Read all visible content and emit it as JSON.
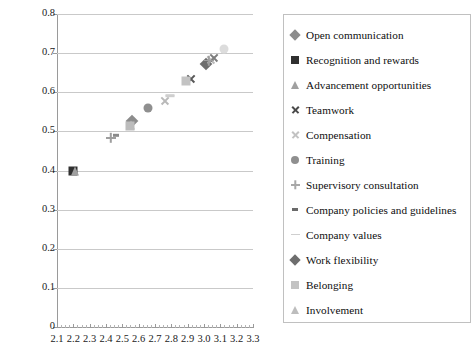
{
  "chart_data": {
    "type": "scatter",
    "title": "",
    "xlabel": "",
    "ylabel": "",
    "xlim": [
      2.1,
      3.3
    ],
    "ylim": [
      0.0,
      0.8
    ],
    "xticks": [
      "2.1",
      "2.2",
      "2.3",
      "2.4",
      "2.5",
      "2.6",
      "2.7",
      "2.8",
      "2.9",
      "3.0",
      "3.1",
      "3.2",
      "3.3"
    ],
    "yticks": [
      "0",
      "0.1",
      "0.2",
      "0.3",
      "0.4",
      "0.5",
      "0.6",
      "0.7",
      "0.8"
    ],
    "grid": "horizontal",
    "legend_position": "right",
    "series": [
      {
        "name": "Open communication",
        "marker": "diamond",
        "color": "#8c8c8c",
        "x": 2.56,
        "y": 0.527
      },
      {
        "name": "Recognition and rewards",
        "marker": "square",
        "color": "#303030",
        "x": 2.2,
        "y": 0.4
      },
      {
        "name": "Advancement opportunities",
        "marker": "triangle",
        "color": "#a0a0a0",
        "x": 2.21,
        "y": 0.4
      },
      {
        "name": "Teamwork",
        "marker": "cross",
        "color": "#585858",
        "x": 2.92,
        "y": 0.636
      },
      {
        "name": "Compensation",
        "marker": "cross",
        "color": "#b9b9b9",
        "x": 2.76,
        "y": 0.578
      },
      {
        "name": "Training",
        "marker": "circle",
        "color": "#8f8f8f",
        "x": 2.66,
        "y": 0.561
      },
      {
        "name": "Supervisory consultation",
        "marker": "plus",
        "color": "#9e9e9e",
        "x": 2.43,
        "y": 0.484
      },
      {
        "name": "Company policies and guidelines",
        "marker": "dash",
        "color": "#8a8a8a",
        "x": 2.46,
        "y": 0.49
      },
      {
        "name": "Company values",
        "marker": "line",
        "color": "#cfcfcf",
        "x": 2.79,
        "y": 0.59
      },
      {
        "name": "Work flexibility",
        "marker": "diamond",
        "color": "#6e6e6e",
        "x": 3.01,
        "y": 0.672
      },
      {
        "name": "Belonging",
        "marker": "square",
        "color": "#c3c3c3",
        "x": 2.89,
        "y": 0.63
      },
      {
        "name": "Involvement",
        "marker": "triangle",
        "color": "#bdbdbd",
        "x": 2.55,
        "y": 0.516
      }
    ],
    "extra_points": [
      {
        "series": "Company values",
        "marker": "circle",
        "color": "#dcdcdc",
        "x": 3.12,
        "y": 0.71
      },
      {
        "series": "Compensation",
        "marker": "cross",
        "color": "#b9b9b9",
        "x": 3.04,
        "y": 0.684
      },
      {
        "series": "Teamwork",
        "marker": "cross",
        "color": "#7d7d7d",
        "x": 3.06,
        "y": 0.69
      },
      {
        "series": "Supervisory consultation",
        "marker": "plus",
        "color": "#9e9e9e",
        "x": 3.03,
        "y": 0.682
      },
      {
        "series": "Belonging",
        "marker": "square",
        "color": "#bcbcbc",
        "x": 2.545,
        "y": 0.515
      },
      {
        "series": "Company values",
        "marker": "line",
        "color": "#cfcfcf",
        "x": 2.79,
        "y": 0.592
      }
    ]
  },
  "legend": {
    "items": [
      {
        "label": "Open communication",
        "marker": "diamond",
        "color": "#8c8c8c"
      },
      {
        "label": "Recognition and rewards",
        "marker": "square",
        "color": "#303030"
      },
      {
        "label": "Advancement opportunities",
        "marker": "triangle",
        "color": "#a0a0a0"
      },
      {
        "label": "Teamwork",
        "marker": "cross",
        "color": "#4a4a4a"
      },
      {
        "label": "Compensation",
        "marker": "cross",
        "color": "#c2c2c2"
      },
      {
        "label": "Training",
        "marker": "circle",
        "color": "#8f8f8f"
      },
      {
        "label": "Supervisory consultation",
        "marker": "plus",
        "color": "#a8a8a8"
      },
      {
        "label": "Company policies and guidelines",
        "marker": "dash",
        "color": "#6a6a6a"
      },
      {
        "label": "Company values",
        "marker": "line",
        "color": "#cfcfcf"
      },
      {
        "label": "Work flexibility",
        "marker": "diamond",
        "color": "#6e6e6e"
      },
      {
        "label": "Belonging",
        "marker": "square",
        "color": "#c3c3c3"
      },
      {
        "label": "Involvement",
        "marker": "triangle",
        "color": "#bdbdbd"
      }
    ]
  }
}
